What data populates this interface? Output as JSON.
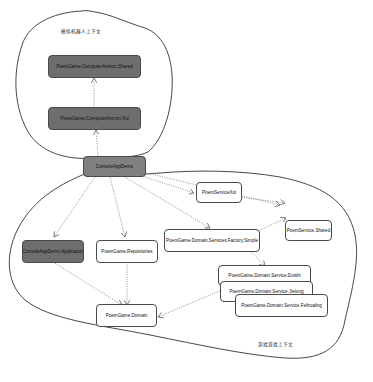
{
  "diagram": {
    "contexts": [
      {
        "id": "robot",
        "label": "模拟机器人上下文"
      },
      {
        "id": "game",
        "label": "游戏游戏上下文"
      }
    ],
    "nodes": [
      {
        "id": "shared_ai",
        "label": "PoemGame.ComputerAnmon.Shared",
        "style": "dark"
      },
      {
        "id": "xiaoi_ai",
        "label": "PoemGame.ComputerAnmon.Xoi",
        "style": "dark"
      },
      {
        "id": "console",
        "label": "ConsoleAppDemo",
        "style": "mid"
      },
      {
        "id": "service_xiaoi",
        "label": "PoemServiceXoi",
        "style": "light"
      },
      {
        "id": "service_shared",
        "label": "PoemService.Shared",
        "style": "light"
      },
      {
        "id": "console_app",
        "label": "ConsoleAppDemo.Application",
        "style": "dark"
      },
      {
        "id": "repositories",
        "label": "PoemGame.Repositories",
        "style": "light"
      },
      {
        "id": "factory",
        "label": "PoemGame.Domain.Services.Factory.Simple",
        "style": "light"
      },
      {
        "id": "duishi",
        "label": "PoemGame.Domain.Service.Duishi",
        "style": "light"
      },
      {
        "id": "jielong",
        "label": "PoemGame.Domain.Service.Jielong",
        "style": "light"
      },
      {
        "id": "feihualing",
        "label": "PoemGame.Domain.Service.Feihualing",
        "style": "light"
      },
      {
        "id": "domain",
        "label": "PoemGame.Domain",
        "style": "light"
      }
    ],
    "edges": [
      {
        "from": "xiaoi_ai",
        "to": "shared_ai",
        "style": "dotted"
      },
      {
        "from": "console",
        "to": "xiaoi_ai",
        "style": "dotted"
      },
      {
        "from": "console",
        "to": "service_xiaoi",
        "style": "dotted"
      },
      {
        "from": "console",
        "to": "service_shared",
        "style": "dotted"
      },
      {
        "from": "console",
        "to": "console_app",
        "style": "dotted"
      },
      {
        "from": "console",
        "to": "repositories",
        "style": "dotted"
      },
      {
        "from": "console",
        "to": "factory",
        "style": "dotted"
      },
      {
        "from": "factory",
        "to": "duishi",
        "style": "dotted"
      },
      {
        "from": "factory",
        "to": "service_shared",
        "style": "dotted"
      },
      {
        "from": "service_xiaoi",
        "to": "service_shared",
        "style": "dotted"
      },
      {
        "from": "repositories",
        "to": "domain",
        "style": "dotted"
      },
      {
        "from": "console_app",
        "to": "domain",
        "style": "dotted"
      },
      {
        "from": "jielong",
        "to": "domain",
        "style": "dotted"
      }
    ],
    "colors": {
      "dark_node": "#6e6e6e",
      "mid_node": "#808080",
      "light_node": "#ffffff",
      "border": "#4a4a4a",
      "edge": "#777777"
    }
  }
}
